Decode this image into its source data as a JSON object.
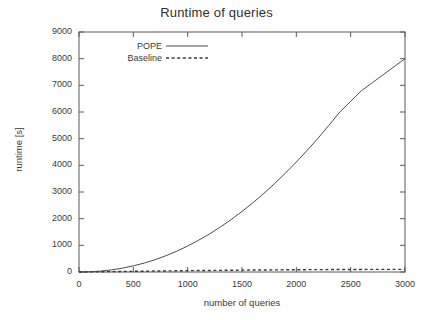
{
  "chart_data": {
    "type": "line",
    "title": "Runtime of queries",
    "xlabel": "number of queries",
    "ylabel": "runtime [s]",
    "xlim": [
      0,
      3000
    ],
    "ylim": [
      0,
      9000
    ],
    "xticks": [
      0,
      500,
      1000,
      1500,
      2000,
      2500,
      3000
    ],
    "yticks": [
      0,
      1000,
      2000,
      3000,
      4000,
      5000,
      6000,
      7000,
      8000,
      9000
    ],
    "xtick_labels": [
      "0",
      "500",
      "1000",
      "1500",
      "2000",
      "2500",
      "3000"
    ],
    "ytick_labels": [
      "0",
      "1000",
      "2000",
      "3000",
      "4000",
      "5000",
      "6000",
      "7000",
      "8000",
      "9000"
    ],
    "grid": false,
    "legend_position": "top-left-inside",
    "line_color": "#4d4d4d",
    "frame_color": "#5a5a5a",
    "background": "#ffffff",
    "x": [
      0,
      100,
      200,
      300,
      400,
      500,
      600,
      700,
      800,
      900,
      1000,
      1100,
      1200,
      1300,
      1400,
      1500,
      1600,
      1700,
      1800,
      1900,
      2000,
      2100,
      2200,
      2300,
      2400,
      2500,
      2600,
      2700,
      2800,
      2900,
      3000
    ],
    "series": [
      {
        "name": "POPE",
        "style": "solid",
        "values": [
          0,
          10,
          35,
          80,
          145,
          230,
          335,
          460,
          610,
          780,
          975,
          1190,
          1425,
          1685,
          1965,
          2270,
          2595,
          2945,
          3315,
          3710,
          4125,
          4560,
          5020,
          5500,
          6000,
          6400,
          6800,
          7100,
          7400,
          7700,
          8000
        ]
      },
      {
        "name": "Baseline",
        "style": "dotted",
        "values": [
          0,
          5,
          10,
          15,
          20,
          25,
          30,
          35,
          40,
          45,
          50,
          54,
          58,
          62,
          66,
          70,
          73,
          76,
          79,
          82,
          85,
          87,
          89,
          91,
          93,
          95,
          96,
          97,
          98,
          99,
          100
        ]
      }
    ]
  },
  "legend": {
    "entries": [
      {
        "label": "POPE",
        "style": "solid"
      },
      {
        "label": "Baseline",
        "style": "dotted"
      }
    ]
  }
}
